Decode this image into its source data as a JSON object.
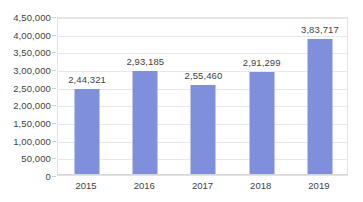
{
  "chart_data": {
    "type": "bar",
    "title": "",
    "subtitle": "",
    "xlabel": "",
    "ylabel": "",
    "categories": [
      "2015",
      "2016",
      "2017",
      "2018",
      "2019"
    ],
    "values": [
      244321,
      293185,
      255460,
      291299,
      383717
    ],
    "value_labels": [
      "2,44,321",
      "2,93,185",
      "2,55,460",
      "2,91,299",
      "3,83,717"
    ],
    "series": [
      {
        "name": "",
        "values": [
          244321,
          293185,
          255460,
          291299,
          383717
        ]
      }
    ],
    "ylim": [
      0,
      450000
    ],
    "ytick_values": [
      0,
      50000,
      100000,
      150000,
      200000,
      250000,
      300000,
      350000,
      400000,
      450000
    ],
    "ytick_labels": [
      "0",
      "50,000",
      "1,00,000",
      "1,50,000",
      "2,00,000",
      "2,50,000",
      "3,00,000",
      "3,50,000",
      "4,00,000",
      "4,50,000"
    ],
    "grid": true,
    "grid_axis": "y",
    "legend": false,
    "legend_position": "none",
    "number_format": "indian-grouping",
    "data_labels_shown": true,
    "colors": {
      "bar": "#7f8fdb",
      "gridline": "#e8e8e8",
      "plot_border": "#e3e3e3",
      "text": "#3f3f3f",
      "background": "#ffffff"
    }
  }
}
